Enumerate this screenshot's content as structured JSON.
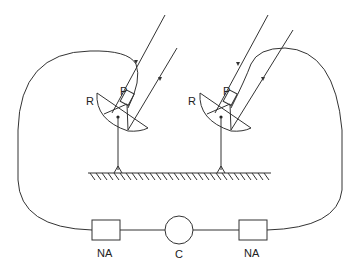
{
  "diagram": {
    "title": "",
    "nodes": [
      {
        "id": "dish-left",
        "label": "R",
        "feed_label": "P"
      },
      {
        "id": "dish-right",
        "label": "R",
        "feed_label": "P"
      },
      {
        "id": "na-left",
        "label": "NA"
      },
      {
        "id": "combiner",
        "label": "C"
      },
      {
        "id": "na-right",
        "label": "NA"
      }
    ],
    "labels": {
      "dish_left_r": "R",
      "dish_left_p": "P",
      "dish_right_r": "R",
      "dish_right_p": "P",
      "na_left": "NA",
      "combiner": "C",
      "na_right": "NA"
    },
    "edges": [
      {
        "from": "dish-left",
        "to": "na-left"
      },
      {
        "from": "na-left",
        "to": "combiner"
      },
      {
        "from": "combiner",
        "to": "na-right"
      },
      {
        "from": "na-right",
        "to": "dish-right"
      }
    ],
    "colors": {
      "line": "#333333",
      "background": "#ffffff"
    }
  }
}
